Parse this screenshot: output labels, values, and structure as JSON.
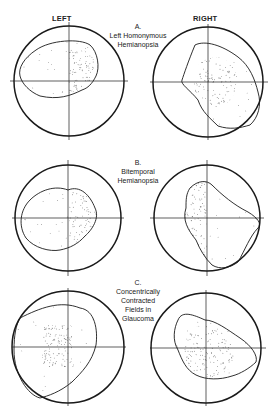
{
  "headers": {
    "left": "LEFT",
    "right": "RIGHT"
  },
  "panels": [
    {
      "id": "A",
      "letter": "A.",
      "lines": [
        "Left Homonymous",
        "Hemianopsia"
      ]
    },
    {
      "id": "B",
      "letter": "B.",
      "lines": [
        "Bitemporal",
        "Hemianopsia"
      ]
    },
    {
      "id": "C",
      "letter": "C.",
      "lines": [
        "Concentrically",
        "Contracted",
        "Fields in",
        "Glaucoma"
      ]
    }
  ],
  "colors": {
    "ink": "#1a1a1a",
    "stipple": "#555555",
    "background": "#ffffff"
  }
}
